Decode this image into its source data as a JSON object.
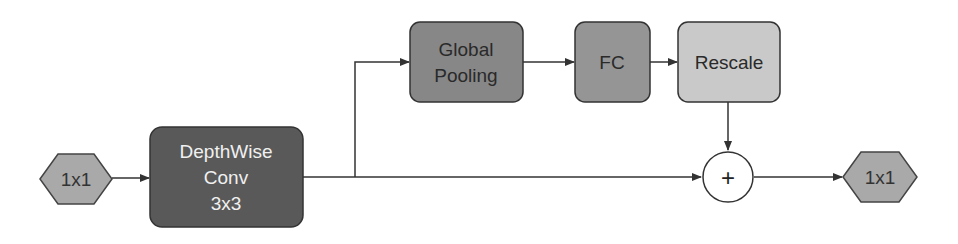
{
  "diagram": {
    "type": "block-flow",
    "nodes": {
      "input": {
        "label": "1x1",
        "shape": "hexagon",
        "fill": "#a9a9a9",
        "text_color": "#333333"
      },
      "depthwise": {
        "lines": [
          "DepthWise",
          "Conv",
          "3x3"
        ],
        "shape": "rounded-rect",
        "fill": "#595959",
        "text_color": "#f0f0f0"
      },
      "global_pooling": {
        "lines": [
          "Global",
          "Pooling"
        ],
        "shape": "rounded-rect",
        "fill": "#878787",
        "text_color": "#2a2a2a"
      },
      "fc": {
        "label": "FC",
        "shape": "rounded-rect",
        "fill": "#959595",
        "text_color": "#2a2a2a"
      },
      "rescale": {
        "label": "Rescale",
        "shape": "rounded-rect",
        "fill": "#c9c9c9",
        "text_color": "#2a2a2a"
      },
      "add": {
        "label": "+",
        "shape": "circle",
        "fill": "#ffffff",
        "text_color": "#222222"
      },
      "output": {
        "label": "1x1",
        "shape": "hexagon",
        "fill": "#a9a9a9",
        "text_color": "#333333"
      }
    },
    "edges": [
      {
        "from": "input",
        "to": "depthwise"
      },
      {
        "from": "depthwise",
        "to": "global_pooling"
      },
      {
        "from": "global_pooling",
        "to": "fc"
      },
      {
        "from": "fc",
        "to": "rescale"
      },
      {
        "from": "rescale",
        "to": "add"
      },
      {
        "from": "depthwise",
        "to": "add"
      },
      {
        "from": "add",
        "to": "output"
      }
    ],
    "colors": {
      "stroke": "#333333",
      "line": "#333333"
    }
  }
}
